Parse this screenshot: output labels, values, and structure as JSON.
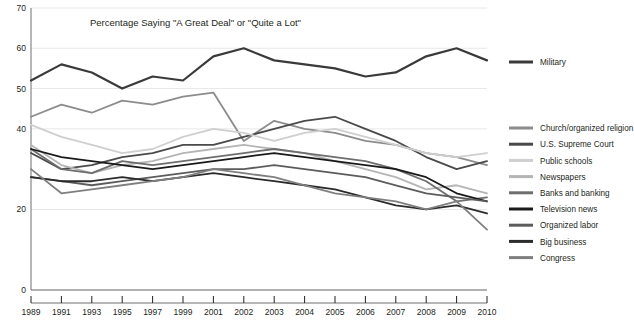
{
  "chart_data": {
    "type": "line",
    "title": "Percentage Saying \"A Great Deal\" or \"Quite a Lot\"",
    "xlabel": "",
    "ylabel": "",
    "ylim": [
      0,
      70
    ],
    "yticks": [
      0,
      20,
      40,
      50,
      60,
      70
    ],
    "ytick_labels": [
      "0",
      "20",
      "40",
      "50",
      "60",
      "70"
    ],
    "grid": true,
    "legend_position": "right",
    "x": [
      "1989",
      "1991",
      "1993",
      "1995",
      "1997",
      "1999",
      "2001",
      "2002",
      "2003",
      "2004",
      "2005",
      "2006",
      "2007",
      "2008",
      "2009",
      "2010"
    ],
    "categories": [
      "1989",
      "1991",
      "1993",
      "1995",
      "1997",
      "1999",
      "2001",
      "2002",
      "2003",
      "2004",
      "2005",
      "2006",
      "2007",
      "2008",
      "2009",
      "2010"
    ],
    "series": [
      {
        "name": "Military",
        "color": "#3a3a3a",
        "values": [
          52,
          56,
          54,
          50,
          53,
          52,
          58,
          60,
          57,
          56,
          55,
          53,
          54,
          58,
          60,
          57
        ]
      },
      {
        "name": "Church/organized religion",
        "color": "#8c8c8c",
        "values": [
          43,
          46,
          44,
          47,
          46,
          48,
          49,
          37,
          42,
          40,
          39,
          37,
          36,
          34,
          33,
          31
        ]
      },
      {
        "name": "U.S. Supreme Court",
        "color": "#4a4a4a",
        "values": [
          34,
          30,
          31,
          33,
          34,
          36,
          36,
          38,
          40,
          42,
          43,
          40,
          37,
          33,
          30,
          32
        ]
      },
      {
        "name": "Public schools",
        "color": "#cfcfcf",
        "values": [
          41,
          38,
          36,
          34,
          35,
          38,
          40,
          39,
          37,
          39,
          40,
          38,
          36,
          34,
          33,
          34
        ]
      },
      {
        "name": "Newspapers",
        "color": "#b5b5b5",
        "values": [
          36,
          31,
          29,
          31,
          32,
          34,
          35,
          36,
          35,
          34,
          32,
          30,
          28,
          25,
          26,
          24
        ]
      },
      {
        "name": "Banks and banking",
        "color": "#6e6e6e",
        "values": [
          35,
          30,
          29,
          32,
          31,
          32,
          33,
          34,
          35,
          34,
          33,
          32,
          30,
          27,
          22,
          23
        ]
      },
      {
        "name": "Television news",
        "color": "#1a1a1a",
        "values": [
          35,
          33,
          32,
          31,
          30,
          31,
          32,
          33,
          34,
          33,
          32,
          31,
          30,
          28,
          24,
          22
        ]
      },
      {
        "name": "Organized labor",
        "color": "#5c5c5c",
        "values": [
          28,
          27,
          26,
          27,
          28,
          29,
          30,
          30,
          31,
          30,
          29,
          28,
          26,
          24,
          23,
          22
        ]
      },
      {
        "name": "Big business",
        "color": "#2b2b2b",
        "values": [
          28,
          27,
          27,
          28,
          27,
          28,
          29,
          28,
          27,
          26,
          25,
          23,
          21,
          20,
          21,
          19
        ]
      },
      {
        "name": "Congress",
        "color": "#7f7f7f",
        "values": [
          30,
          24,
          25,
          26,
          27,
          28,
          30,
          29,
          28,
          26,
          24,
          23,
          22,
          20,
          22,
          15
        ]
      }
    ]
  },
  "legend": {
    "groups": [
      {
        "entries": [
          "Military"
        ]
      },
      {
        "entries": [
          "Church/organized religion",
          "U.S. Supreme Court",
          "Public schools",
          "Newspapers",
          "Banks and banking",
          "Television news",
          "Organized labor",
          "Big business",
          "Congress"
        ]
      }
    ]
  }
}
